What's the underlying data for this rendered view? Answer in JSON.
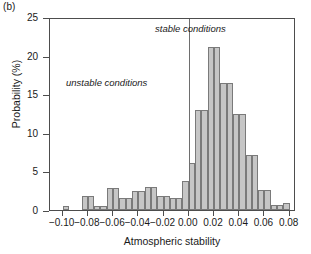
{
  "panel": {
    "label": "(b)"
  },
  "chart_data": {
    "type": "bar",
    "title": "",
    "subtitle": "",
    "xlabel": "Atmospheric stability",
    "ylabel": "Probability (%)",
    "xlim": [
      -0.11,
      0.085
    ],
    "ylim": [
      0,
      25
    ],
    "grid": false,
    "legend_position": "none",
    "bin_width": 0.005,
    "x_ticks": [
      "−0.10",
      "−0.08",
      "−0.06",
      "−0.04",
      "−0.02",
      "0.00",
      "0.02",
      "0.04",
      "0.06",
      "0.08"
    ],
    "x_tick_values": [
      -0.1,
      -0.08,
      -0.06,
      -0.04,
      -0.02,
      0.0,
      0.02,
      0.04,
      0.06,
      0.08
    ],
    "y_ticks": [
      "0",
      "5",
      "10",
      "15",
      "20",
      "25"
    ],
    "y_tick_values": [
      0,
      5,
      10,
      15,
      20,
      25
    ],
    "bin_left_edges": [
      -0.105,
      -0.1,
      -0.095,
      -0.09,
      -0.085,
      -0.08,
      -0.075,
      -0.07,
      -0.065,
      -0.06,
      -0.055,
      -0.05,
      -0.045,
      -0.04,
      -0.035,
      -0.03,
      -0.025,
      -0.02,
      -0.015,
      -0.01,
      -0.005,
      0.0,
      0.005,
      0.01,
      0.015,
      0.02,
      0.025,
      0.03,
      0.035,
      0.04,
      0.045,
      0.05,
      0.055,
      0.06,
      0.065,
      0.07,
      0.075
    ],
    "x": [
      -0.1025,
      -0.0975,
      -0.0925,
      -0.0875,
      -0.0825,
      -0.0775,
      -0.0725,
      -0.0675,
      -0.0625,
      -0.0575,
      -0.0525,
      -0.0475,
      -0.0425,
      -0.0375,
      -0.0325,
      -0.0275,
      -0.0225,
      -0.0175,
      -0.0125,
      -0.0075,
      -0.0025,
      0.0025,
      0.0075,
      0.0125,
      0.0175,
      0.0225,
      0.0275,
      0.0325,
      0.0375,
      0.0425,
      0.0475,
      0.0525,
      0.0575,
      0.0625,
      0.0675,
      0.0725,
      0.0775
    ],
    "values": [
      0.0,
      0.5,
      0.0,
      0.0,
      1.8,
      1.8,
      0.5,
      0.5,
      2.8,
      2.8,
      1.5,
      1.5,
      2.5,
      2.5,
      3.0,
      3.0,
      1.8,
      1.8,
      1.5,
      1.5,
      3.8,
      6.1,
      12.9,
      12.9,
      21.1,
      21.1,
      16.5,
      16.5,
      12.4,
      12.4,
      7.1,
      7.1,
      2.6,
      2.6,
      0.6,
      0.6,
      0.85
    ],
    "categories": [
      "-0.1025",
      "-0.0975",
      "-0.0925",
      "-0.0875",
      "-0.0825",
      "-0.0775",
      "-0.0725",
      "-0.0675",
      "-0.0625",
      "-0.0575",
      "-0.0525",
      "-0.0475",
      "-0.0425",
      "-0.0375",
      "-0.0325",
      "-0.0275",
      "-0.0225",
      "-0.0175",
      "-0.0125",
      "-0.0075",
      "-0.0025",
      "0.0025",
      "0.0075",
      "0.0125",
      "0.0175",
      "0.0225",
      "0.0275",
      "0.0325",
      "0.0375",
      "0.0425",
      "0.0475",
      "0.0525",
      "0.0575",
      "0.0625",
      "0.0675",
      "0.0725",
      "0.0775"
    ],
    "annotations": [
      {
        "text": "stable conditions",
        "x": 0.035,
        "y": 24.0
      },
      {
        "text": "unstable conditions",
        "x": -0.055,
        "y": 17.5
      }
    ],
    "reference_line": {
      "x": 0.0,
      "orientation": "vertical"
    },
    "bar_fill_color": "#c6c6c6",
    "bar_edge_color": "#7a7a7a",
    "axis_color": "#4d4d4d"
  }
}
